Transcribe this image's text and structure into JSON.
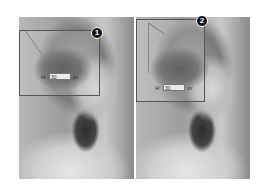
{
  "steps": [
    {
      "badge": "1",
      "field": {
        "label": "H:",
        "value": "30",
        "unit": "px"
      }
    },
    {
      "badge": "2",
      "field": {
        "label": "H:",
        "value": "30",
        "unit": "px"
      }
    }
  ]
}
